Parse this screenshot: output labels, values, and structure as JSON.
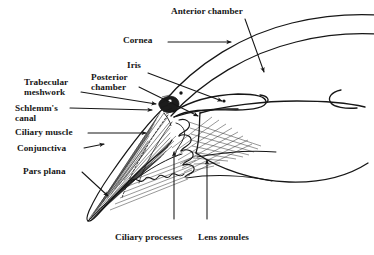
{
  "figure": {
    "type": "anatomical-line-diagram",
    "background_color": "#ffffff",
    "ink_color": "#161616",
    "width": 374,
    "height": 255
  },
  "labels": {
    "anterior_chamber": "Anterior chamber",
    "cornea": "Cornea",
    "iris": "Iris",
    "posterior_chamber_line1": "Posterior",
    "posterior_chamber_line2": "chamber",
    "trabecular_line1": "Trabecular",
    "trabecular_line2": "meshwork",
    "schlemms_line1": "Schlemm's",
    "schlemms_line2": "canal",
    "ciliary_muscle": "Ciliary muscle",
    "conjunctiva": "Conjunctiva",
    "pars_plana": "Pars plana",
    "ciliary_processes": "Ciliary processes",
    "lens_zonules": "Lens zonules"
  },
  "structures": [
    {
      "name": "cornea",
      "description": "Two parallel arcs sweeping from upper-left to right edge"
    },
    {
      "name": "anterior-chamber",
      "description": "Space between cornea and iris"
    },
    {
      "name": "iris",
      "description": "Thin elongated leaf extending right from the angle"
    },
    {
      "name": "posterior-chamber",
      "description": "Narrow space behind iris, in front of lens"
    },
    {
      "name": "trabecular-meshwork",
      "description": "Dark stippled cluster at the iridocorneal angle"
    },
    {
      "name": "schlemms-canal",
      "description": "Small oval lumen adjacent to the trabecular meshwork"
    },
    {
      "name": "ciliary-muscle",
      "description": "Striated wedge tapering to a point at lower left"
    },
    {
      "name": "conjunctiva",
      "description": "Outer surface line over the ciliary wedge"
    },
    {
      "name": "pars-plana",
      "description": "Flat posterior portion of the ciliary body"
    },
    {
      "name": "ciliary-processes",
      "description": "Wavy folded ridges behind the iris root"
    },
    {
      "name": "lens-zonules",
      "description": "Fine radiating suspensory fibers spanning to the lens"
    },
    {
      "name": "lens",
      "description": "Large biconvex body occupying the right half"
    }
  ]
}
